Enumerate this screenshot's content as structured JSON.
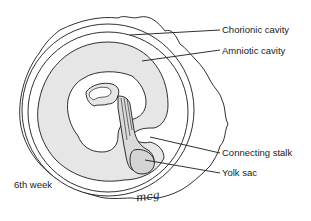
{
  "diagram": {
    "title": "6th week",
    "signature": "mcg",
    "colors": {
      "stroke": "#1a1a1a",
      "cavity_fill": "#e6e6e6",
      "yolk_fill": "#dadada",
      "background": "#ffffff"
    },
    "labels": [
      {
        "id": "chorionic-cavity",
        "text": "Chorionic cavity"
      },
      {
        "id": "amniotic-cavity",
        "text": "Amniotic cavity"
      },
      {
        "id": "connecting-stalk",
        "text": "Connecting stalk"
      },
      {
        "id": "yolk-sac",
        "text": "Yolk sac"
      }
    ]
  }
}
